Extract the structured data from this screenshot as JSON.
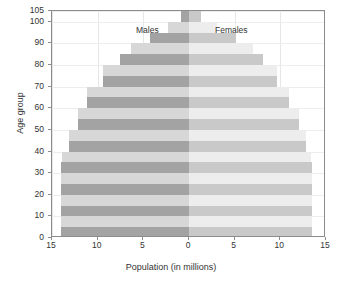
{
  "chart_data": {
    "type": "bar",
    "title": "",
    "subtype": "population-pyramid",
    "xlabel": "Population (in millions)",
    "ylabel": "Age group",
    "xlim": [
      -15,
      15
    ],
    "ylim": [
      0,
      105
    ],
    "xticks": [
      15,
      10,
      5,
      0,
      5,
      10,
      15
    ],
    "yticks": [
      0,
      10,
      20,
      30,
      40,
      50,
      60,
      70,
      80,
      90,
      100,
      105
    ],
    "grid": true,
    "legend_position": "in-plot-annotations",
    "categories": [
      "0",
      "5",
      "10",
      "15",
      "20",
      "25",
      "30",
      "35",
      "40",
      "45",
      "50",
      "55",
      "60",
      "65",
      "70",
      "75",
      "80",
      "85",
      "90",
      "95",
      "100"
    ],
    "series": [
      {
        "name": "Males",
        "side": "left",
        "values": [
          14.0,
          14.0,
          14.0,
          14.0,
          14.0,
          14.0,
          14.0,
          13.9,
          13.1,
          13.1,
          12.2,
          12.2,
          11.2,
          11.2,
          9.4,
          9.4,
          7.6,
          6.3,
          4.3,
          2.3,
          0.9
        ]
      },
      {
        "name": "Females",
        "side": "right",
        "values": [
          13.5,
          13.5,
          13.5,
          13.5,
          13.5,
          13.5,
          13.5,
          13.4,
          12.8,
          12.8,
          12.0,
          12.0,
          11.0,
          11.0,
          9.6,
          9.6,
          8.1,
          7.0,
          5.2,
          3.1,
          1.3
        ]
      }
    ],
    "annotations": [
      {
        "text": "Males",
        "side": "left"
      },
      {
        "text": "Females",
        "side": "right"
      }
    ],
    "colors": {
      "male_dark": "#a3a3a3",
      "male_light": "#d7d7d7",
      "female_dark": "#c9c9c9",
      "female_light": "#ededed",
      "axis": "#8c8c8c",
      "grid": "#e6e6e6",
      "text": "#333333"
    }
  },
  "caption": ""
}
